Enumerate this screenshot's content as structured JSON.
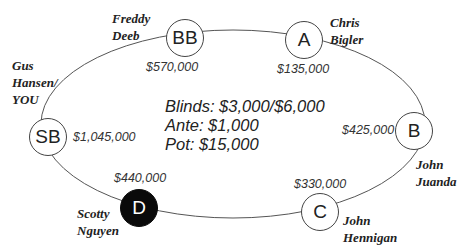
{
  "table": {
    "blinds": "Blinds: $3,000/$6,000",
    "ante": "Ante: $1,000",
    "pot": "Pot: $15,000"
  },
  "seats": [
    {
      "position": "BB",
      "player": "Freddy\nDeeb",
      "stack": "$570,000"
    },
    {
      "position": "A",
      "player": "Chris\nBigler",
      "stack": "$135,000"
    },
    {
      "position": "B",
      "player": "John\nJuanda",
      "stack": "$425,000"
    },
    {
      "position": "C",
      "player": "John\nHennigan",
      "stack": "$330,000"
    },
    {
      "position": "D",
      "player": "Scotty\nNguyen",
      "stack": "$440,000"
    },
    {
      "position": "SB",
      "player": "Gus\nHansen/\nYOU",
      "stack": "$1,045,000"
    }
  ],
  "colors": {
    "dealer_fill": "#0a0a0a",
    "line": "#444444"
  }
}
